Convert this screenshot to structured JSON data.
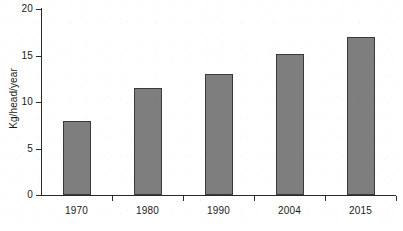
{
  "chart_data": {
    "type": "bar",
    "title": "",
    "subtitle": "",
    "xlabel": "",
    "ylabel": "Kg/head/year",
    "categories": [
      "1970",
      "1980",
      "1990",
      "2004",
      "2015"
    ],
    "values": [
      8.0,
      11.5,
      13.0,
      15.2,
      17.0
    ],
    "ylim": [
      0,
      20
    ],
    "yticks": [
      0,
      5,
      10,
      15,
      20
    ],
    "ytick_labels": [
      "0",
      "5",
      "10",
      "15",
      "20"
    ],
    "grid": false,
    "legend": false,
    "legend_position": "none",
    "bar_color": "#7e7e7e",
    "bar_border_color": "#3a3a3a",
    "axis_color": "#2b2b2b",
    "background_color": "#ffffff"
  }
}
